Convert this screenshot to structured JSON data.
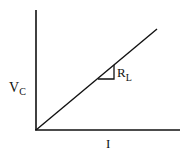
{
  "diagram": {
    "y_axis_label": {
      "main": "V",
      "sub": "C"
    },
    "x_axis_label": "I",
    "slope_label": {
      "main": "R",
      "sub": "L"
    },
    "colors": {
      "line": "#111111",
      "background": "#ffffff"
    }
  }
}
